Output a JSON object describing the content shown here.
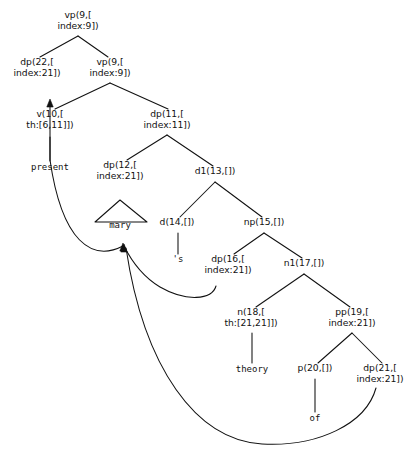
{
  "diagram": {
    "width": 417,
    "height": 454,
    "background": "#ffffff",
    "line_color": "#111111"
  },
  "nodes": [
    {
      "id": "n9a",
      "label_line1": "vp(9,[",
      "label_line2": "index:9])",
      "x": 78,
      "y": 18,
      "kind": "nonterminal"
    },
    {
      "id": "n22",
      "label_line1": "dp(22,[",
      "label_line2": "index:21])",
      "x": 37,
      "y": 65,
      "kind": "nonterminal"
    },
    {
      "id": "n9b",
      "label_line1": "vp(9,[",
      "label_line2": "index:9])",
      "x": 110,
      "y": 65,
      "kind": "nonterminal"
    },
    {
      "id": "n10",
      "label_line1": "v(10,[",
      "label_line2": "th:[6,11]])",
      "x": 50,
      "y": 117,
      "kind": "nonterminal"
    },
    {
      "id": "n11",
      "label_line1": "dp(11,[",
      "label_line2": "index:11])",
      "x": 167,
      "y": 117,
      "kind": "nonterminal"
    },
    {
      "id": "n12",
      "label_line1": "dp(12,[",
      "label_line2": "index:21])",
      "x": 120,
      "y": 168,
      "kind": "nonterminal"
    },
    {
      "id": "n13",
      "label_line1": "d1(13,[])",
      "label_line2": "",
      "x": 215,
      "y": 174,
      "kind": "nonterminal"
    },
    {
      "id": "n14",
      "label_line1": "d(14,[])",
      "label_line2": "",
      "x": 177,
      "y": 225,
      "kind": "nonterminal"
    },
    {
      "id": "n15",
      "label_line1": "np(15,[])",
      "label_line2": "",
      "x": 264,
      "y": 225,
      "kind": "nonterminal"
    },
    {
      "id": "n16",
      "label_line1": "dp(16,[",
      "label_line2": "index:21])",
      "x": 228,
      "y": 262,
      "kind": "nonterminal"
    },
    {
      "id": "n17",
      "label_line1": "n1(17,[])",
      "label_line2": "",
      "x": 304,
      "y": 266,
      "kind": "nonterminal"
    },
    {
      "id": "n18",
      "label_line1": "n(18,[",
      "label_line2": "th:[21,21]])",
      "x": 251,
      "y": 315,
      "kind": "nonterminal"
    },
    {
      "id": "n19",
      "label_line1": "pp(19,[",
      "label_line2": "index:21])",
      "x": 352,
      "y": 315,
      "kind": "nonterminal"
    },
    {
      "id": "n20",
      "label_line1": "p(20,[])",
      "label_line2": "",
      "x": 315,
      "y": 371,
      "kind": "nonterminal"
    },
    {
      "id": "n21",
      "label_line1": "dp(21,[",
      "label_line2": "index:21])",
      "x": 380,
      "y": 371,
      "kind": "nonterminal"
    }
  ],
  "leaves": [
    {
      "id": "w-present",
      "label": "present",
      "x": 50,
      "y": 170
    },
    {
      "id": "w-mary",
      "label": "mary",
      "x": 120,
      "y": 228
    },
    {
      "id": "w-s",
      "label": "'s",
      "x": 178,
      "y": 262
    },
    {
      "id": "w-theory",
      "label": "theory",
      "x": 252,
      "y": 372
    },
    {
      "id": "w-of",
      "label": "of",
      "x": 315,
      "y": 421
    }
  ],
  "edges": [
    {
      "from": "n9a",
      "to": "n22",
      "from_x": 78,
      "from_y": 36,
      "to_x": 40,
      "to_y": 57
    },
    {
      "from": "n9a",
      "to": "n9b",
      "from_x": 78,
      "from_y": 36,
      "to_x": 108,
      "to_y": 57
    },
    {
      "from": "n9b",
      "to": "n10",
      "from_x": 110,
      "from_y": 83,
      "to_x": 55,
      "to_y": 109
    },
    {
      "from": "n9b",
      "to": "n11",
      "from_x": 110,
      "from_y": 83,
      "to_x": 168,
      "to_y": 109
    },
    {
      "from": "n10",
      "to": "w-present",
      "from_x": 50,
      "from_y": 137,
      "to_x": 50,
      "to_y": 161,
      "style": "vertical"
    },
    {
      "from": "n11",
      "to": "n12",
      "from_x": 167,
      "from_y": 135,
      "to_x": 127,
      "to_y": 160
    },
    {
      "from": "n11",
      "to": "n13",
      "from_x": 167,
      "from_y": 135,
      "to_x": 213,
      "to_y": 166
    },
    {
      "from": "n13",
      "to": "n14",
      "from_x": 215,
      "from_y": 182,
      "to_x": 180,
      "to_y": 217
    },
    {
      "from": "n13",
      "to": "n15",
      "from_x": 215,
      "from_y": 182,
      "to_x": 262,
      "to_y": 217
    },
    {
      "from": "n14",
      "to": "w-s",
      "from_x": 178,
      "from_y": 233,
      "to_x": 178,
      "to_y": 254,
      "style": "vertical"
    },
    {
      "from": "n15",
      "to": "n16",
      "from_x": 264,
      "from_y": 233,
      "to_x": 234,
      "to_y": 254
    },
    {
      "from": "n15",
      "to": "n17",
      "from_x": 264,
      "from_y": 233,
      "to_x": 302,
      "to_y": 258
    },
    {
      "from": "n17",
      "to": "n18",
      "from_x": 304,
      "from_y": 274,
      "to_x": 256,
      "to_y": 307
    },
    {
      "from": "n17",
      "to": "n19",
      "from_x": 304,
      "from_y": 274,
      "to_x": 350,
      "to_y": 307
    },
    {
      "from": "n18",
      "to": "w-theory",
      "from_x": 252,
      "from_y": 333,
      "to_x": 252,
      "to_y": 363,
      "style": "vertical"
    },
    {
      "from": "n19",
      "to": "n20",
      "from_x": 352,
      "from_y": 333,
      "to_x": 318,
      "to_y": 363
    },
    {
      "from": "n19",
      "to": "n21",
      "from_x": 352,
      "from_y": 333,
      "to_x": 382,
      "to_y": 363
    },
    {
      "from": "n20",
      "to": "w-of",
      "from_x": 315,
      "from_y": 379,
      "to_x": 315,
      "to_y": 412,
      "style": "vertical"
    }
  ],
  "triangles": [
    {
      "id": "tri-mary",
      "for_node": "n12",
      "apex_x": 120,
      "apex_y": 200,
      "left_x": 95,
      "right_x": 147,
      "base_y": 222
    }
  ],
  "movement_arcs": [
    {
      "id": "arc-mary-to-dp22",
      "from": "mary-trace",
      "to": "dp(22,[index:21])",
      "path": "M 123 246 C 92 262, 62 242, 50 160 L 50 104",
      "arrow_at": {
        "x": 50,
        "y": 99,
        "direction": "up"
      }
    },
    {
      "id": "arc-dp16-to-mary",
      "from": "dp(16,[index:21])",
      "to": "mary-trace",
      "path": "M 216 286 C 212 300, 186 302, 160 287 C 145 278, 132 262, 124 246",
      "arrow_at": {
        "x": 123,
        "y": 243,
        "direction": "up"
      }
    },
    {
      "id": "arc-dp21-to-mary",
      "from": "dp(21,[index:21])",
      "to": "mary-trace",
      "path": "M 376 388 C 366 424, 318 447, 262 444 C 196 440, 144 368, 126 248",
      "arrow_at": {
        "x": 124,
        "y": 244,
        "direction": "up"
      }
    }
  ]
}
